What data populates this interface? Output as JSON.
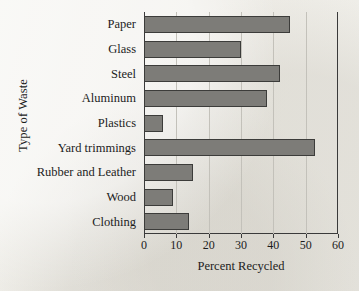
{
  "chart_data": {
    "type": "bar",
    "orientation": "horizontal",
    "title": "",
    "xlabel": "Percent Recycled",
    "ylabel": "Type of Waste",
    "categories": [
      "Paper",
      "Glass",
      "Steel",
      "Aluminum",
      "Plastics",
      "Yard trimmings",
      "Rubber and Leather",
      "Wood",
      "Clothing"
    ],
    "values": [
      45,
      30,
      42,
      38,
      6,
      53,
      15,
      9,
      14
    ],
    "xlim": [
      0,
      60
    ],
    "xticks": [
      0,
      10,
      20,
      30,
      40,
      50,
      60
    ],
    "xtick_labels": [
      "0",
      "10",
      "20",
      "30",
      "40",
      "50",
      "60"
    ],
    "grid": "vertical",
    "legend": "none",
    "bar_color": "#7d7c78",
    "bar_edge_color": "#3c3c3a",
    "axis_color": "#3a3a3a",
    "gridline_color": "#c3c1ba",
    "background_color": "#efeeea"
  }
}
